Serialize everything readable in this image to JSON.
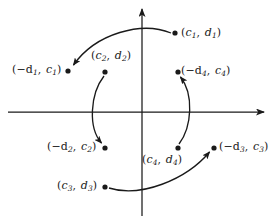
{
  "figure": {
    "axes": {
      "x_axis_name": "horizontal-axis",
      "y_axis_name": "vertical-axis",
      "origin_x": 142,
      "origin_y": 112,
      "stroke_color": "#1a1a1a"
    },
    "points": [
      {
        "id": "p1",
        "label_prefix": "(",
        "var1": "c",
        "sub1": "1",
        "sep": ",",
        "var2": "d",
        "sub2": "1",
        "label_suffix": ")",
        "negative1": false,
        "x": 175,
        "y": 33,
        "label_x": 181,
        "label_y": 27
      },
      {
        "id": "p1i",
        "label_prefix": "(",
        "var1": "d",
        "sub1": "1",
        "sep": ",",
        "var2": "c",
        "sub2": "1",
        "label_suffix": ")",
        "negative1": true,
        "x": 68,
        "y": 71,
        "label_x": 12,
        "label_y": 64
      },
      {
        "id": "p2",
        "label_prefix": "(",
        "var1": "c",
        "sub1": "2",
        "sep": ",",
        "var2": "d",
        "sub2": "2",
        "label_suffix": ")",
        "negative1": false,
        "x": 105,
        "y": 72,
        "label_x": 91,
        "label_y": 50
      },
      {
        "id": "p2i",
        "label_prefix": "(",
        "var1": "d",
        "sub1": "2",
        "sep": ",",
        "var2": "c",
        "sub2": "2",
        "label_suffix": ")",
        "negative1": true,
        "x": 105,
        "y": 148,
        "label_x": 47,
        "label_y": 141
      },
      {
        "id": "p3",
        "label_prefix": "(",
        "var1": "c",
        "sub1": "3",
        "sep": ",",
        "var2": "d",
        "sub2": "3",
        "label_suffix": ")",
        "negative1": false,
        "x": 105,
        "y": 187,
        "label_x": 57,
        "label_y": 180
      },
      {
        "id": "p3i",
        "label_prefix": "(",
        "var1": "d",
        "sub1": "3",
        "sep": ",",
        "var2": "c",
        "sub2": "3",
        "label_suffix": ")",
        "negative1": true,
        "x": 214,
        "y": 148,
        "label_x": 219,
        "label_y": 141
      },
      {
        "id": "p4",
        "label_prefix": "(",
        "var1": "c",
        "sub1": "4",
        "sep": ",",
        "var2": "d",
        "sub2": "4",
        "label_suffix": ")",
        "negative1": false,
        "x": 178,
        "y": 148,
        "label_x": 142,
        "label_y": 154
      },
      {
        "id": "p4i",
        "label_prefix": "(",
        "var1": "d",
        "sub1": "4",
        "sep": ",",
        "var2": "c",
        "sub2": "4",
        "label_suffix": ")",
        "negative1": true,
        "x": 178,
        "y": 72,
        "label_x": 181,
        "label_y": 65
      }
    ],
    "arrows": [
      {
        "id": "a1",
        "from": "p1",
        "to": "p1i",
        "description": "arc from (c1,d1) over the top to (-d1,c1)"
      },
      {
        "id": "a2",
        "from": "p2",
        "to": "p2i",
        "description": "arc from (c2,d2) around the left to (-d2,c2)"
      },
      {
        "id": "a3",
        "from": "p3",
        "to": "p3i",
        "description": "arc from (c3,d3) under the bottom to (-d3,c3)"
      },
      {
        "id": "a4",
        "from": "p4",
        "to": "p4i",
        "description": "arc from (c4,d4) around the right to (-d4,c4)"
      }
    ]
  }
}
